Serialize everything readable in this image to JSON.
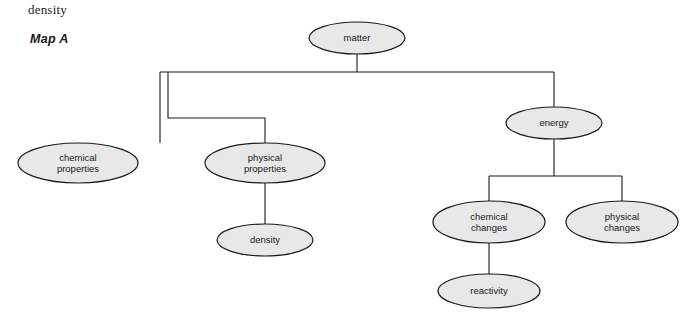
{
  "page": {
    "top_label": "density",
    "map_label": "Map A"
  },
  "diagram": {
    "type": "concept-map",
    "nodes": [
      {
        "id": "matter",
        "label_lines": [
          "matter"
        ],
        "cx": 357,
        "cy": 38,
        "rx": 48,
        "ry": 16
      },
      {
        "id": "energy",
        "label_lines": [
          "energy"
        ],
        "cx": 554,
        "cy": 123,
        "rx": 48,
        "ry": 16
      },
      {
        "id": "chemical_properties",
        "label_lines": [
          "chemical",
          "properties"
        ],
        "cx": 78,
        "cy": 163,
        "rx": 60,
        "ry": 20
      },
      {
        "id": "physical_properties",
        "label_lines": [
          "physical",
          "properties"
        ],
        "cx": 265,
        "cy": 163,
        "rx": 60,
        "ry": 20
      },
      {
        "id": "density",
        "label_lines": [
          "density"
        ],
        "cx": 265,
        "cy": 240,
        "rx": 48,
        "ry": 16
      },
      {
        "id": "chemical_changes",
        "label_lines": [
          "chemical",
          "changes"
        ],
        "cx": 489,
        "cy": 222,
        "rx": 56,
        "ry": 21
      },
      {
        "id": "physical_changes",
        "label_lines": [
          "physical",
          "changes"
        ],
        "cx": 622,
        "cy": 222,
        "rx": 56,
        "ry": 21
      },
      {
        "id": "reactivity",
        "label_lines": [
          "reactivity"
        ],
        "cx": 489,
        "cy": 291,
        "rx": 51,
        "ry": 17
      }
    ],
    "edges": [
      {
        "from": "matter",
        "to": "branch-bus-top"
      },
      {
        "from": "branch-bus-top",
        "to": "chemical_properties"
      },
      {
        "from": "branch-bus-top",
        "to": "physical_properties"
      },
      {
        "from": "branch-bus-top",
        "to": "energy"
      },
      {
        "from": "physical_properties",
        "to": "density"
      },
      {
        "from": "energy",
        "to": "branch-bus-energy"
      },
      {
        "from": "branch-bus-energy",
        "to": "chemical_changes"
      },
      {
        "from": "branch-bus-energy",
        "to": "physical_changes"
      },
      {
        "from": "chemical_changes",
        "to": "reactivity"
      }
    ],
    "colors": {
      "node_fill": "#e8e8e8",
      "node_stroke": "#1a1a1a",
      "edge_stroke": "#1a1a1a",
      "text": "#1a1a1a",
      "background": "#ffffff"
    }
  }
}
